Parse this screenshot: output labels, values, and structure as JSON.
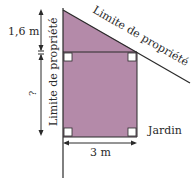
{
  "diagram": {
    "labels": {
      "top_height": "1,6 m",
      "unknown_height": "?",
      "width": "3 m",
      "left_boundary": "Limite de propriété",
      "diagonal_boundary": "Limite de propriété",
      "garden": "Jardin"
    },
    "colors": {
      "fill": "#b48aa9",
      "stroke": "#2a2a2a"
    }
  }
}
